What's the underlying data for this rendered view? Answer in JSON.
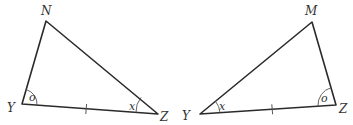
{
  "figure": {
    "triangles": [
      {
        "id": "NYZ",
        "vertices": {
          "top": {
            "label": "N"
          },
          "bottom_left": {
            "label": "Y"
          },
          "bottom_right": {
            "label": "Z"
          }
        },
        "angles": {
          "at_Y": "o",
          "at_Z": "x"
        },
        "tick_marks": {
          "side_YZ": 1
        }
      },
      {
        "id": "MYZ",
        "vertices": {
          "top": {
            "label": "M"
          },
          "bottom_left": {
            "label": "Y"
          },
          "bottom_right": {
            "label": "Z"
          }
        },
        "angles": {
          "at_Y": "x",
          "at_Z": "o"
        },
        "tick_marks": {
          "side_YZ": 1
        }
      }
    ],
    "colors": {
      "line": "#2a2a2a",
      "text": "#333333",
      "background": "#ffffff"
    }
  }
}
